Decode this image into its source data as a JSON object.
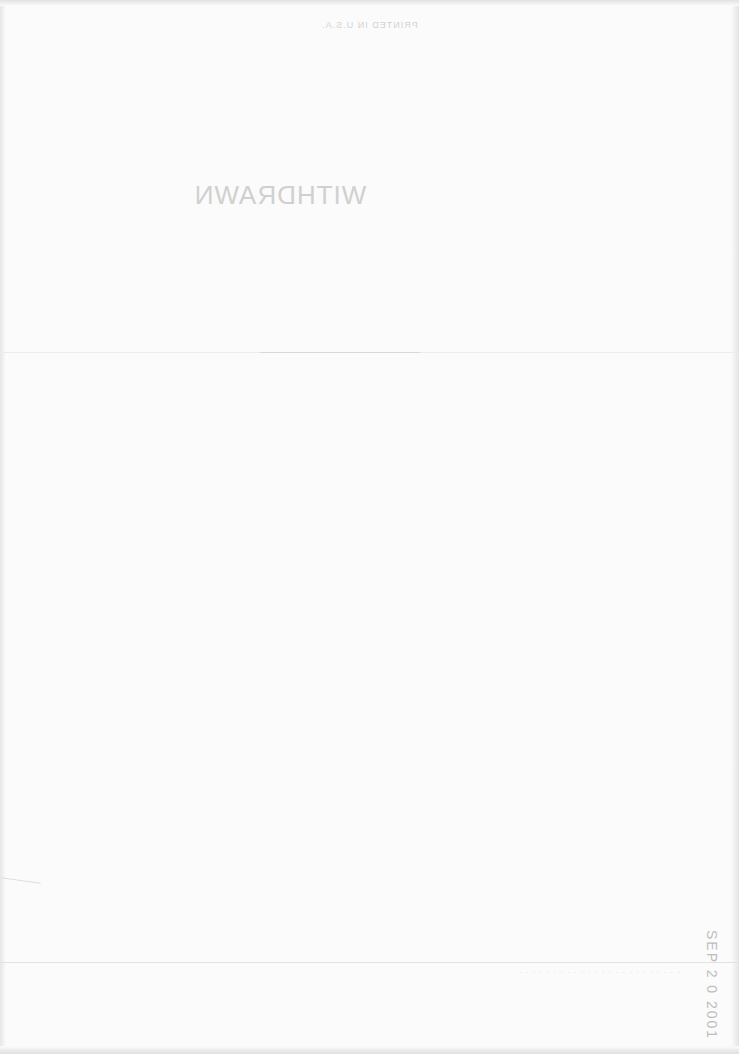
{
  "page": {
    "type": "scanned-blank-page",
    "background_color": "#fbfbfb"
  },
  "header": {
    "showthrough_text": "PRINTED IN U.S.A."
  },
  "stamps": {
    "withdrawn": "WITHDRAWN",
    "date": "SEP 2 0 2001"
  },
  "footer": {
    "showthrough_text": "· · · · · · · · · · · · · · · · · · · · · · · ·"
  }
}
